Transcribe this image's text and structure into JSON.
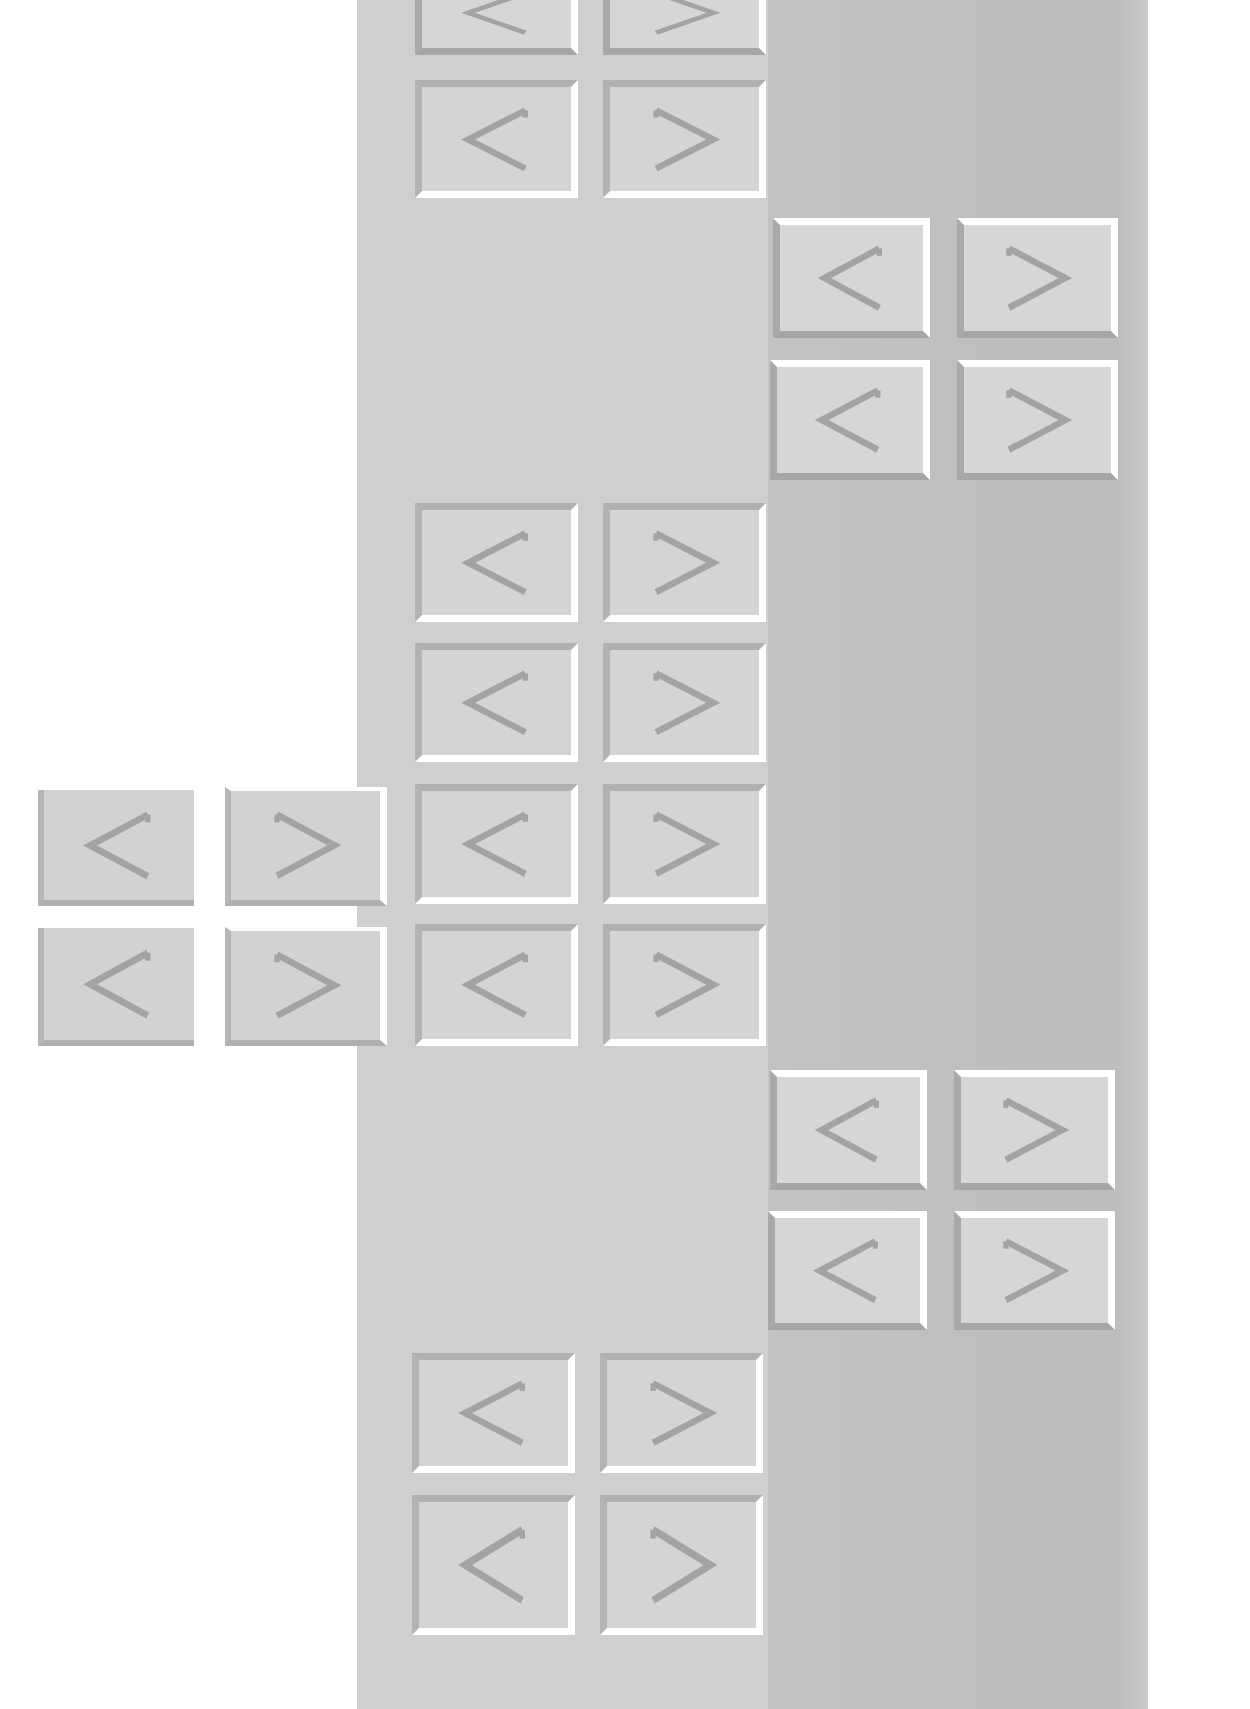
{
  "colors": {
    "page_background": "#ffffff",
    "middle_band": "#cfcfcf",
    "right_band": "#bfbfbf",
    "tile_face": "#d6d6d6",
    "highlight": "#ffffff",
    "shadow": "#a9a9a9",
    "glyph": "#a3a3a3"
  },
  "symbols": {
    "less_than": "<",
    "greater_than": ">"
  },
  "tiles": [
    {
      "id": "m0a",
      "symbol": "<",
      "style": "raised",
      "x": 415,
      "y": -30,
      "w": 163,
      "h": 85
    },
    {
      "id": "m0b",
      "symbol": ">",
      "style": "raised",
      "x": 603,
      "y": -30,
      "w": 163,
      "h": 85
    },
    {
      "id": "m1a",
      "symbol": "<",
      "style": "recessed",
      "x": 415,
      "y": 80,
      "w": 163,
      "h": 118
    },
    {
      "id": "m1b",
      "symbol": ">",
      "style": "recessed",
      "x": 603,
      "y": 80,
      "w": 163,
      "h": 118
    },
    {
      "id": "r1a",
      "symbol": "<",
      "style": "raised",
      "x": 773,
      "y": 218,
      "w": 157,
      "h": 120
    },
    {
      "id": "r1b",
      "symbol": ">",
      "style": "raised",
      "x": 957,
      "y": 218,
      "w": 161,
      "h": 120
    },
    {
      "id": "r2a",
      "symbol": "<",
      "style": "raised",
      "x": 770,
      "y": 360,
      "w": 160,
      "h": 120
    },
    {
      "id": "r2b",
      "symbol": ">",
      "style": "raised",
      "x": 957,
      "y": 360,
      "w": 161,
      "h": 120
    },
    {
      "id": "m2a",
      "symbol": "<",
      "style": "recessed",
      "x": 415,
      "y": 503,
      "w": 163,
      "h": 119
    },
    {
      "id": "m2b",
      "symbol": ">",
      "style": "recessed",
      "x": 603,
      "y": 503,
      "w": 163,
      "h": 119
    },
    {
      "id": "m3a",
      "symbol": "<",
      "style": "recessed",
      "x": 415,
      "y": 643,
      "w": 163,
      "h": 119
    },
    {
      "id": "m3b",
      "symbol": ">",
      "style": "recessed",
      "x": 603,
      "y": 643,
      "w": 163,
      "h": 119
    },
    {
      "id": "m4a",
      "symbol": "<",
      "style": "recessed",
      "x": 415,
      "y": 784,
      "w": 163,
      "h": 120
    },
    {
      "id": "m4b",
      "symbol": ">",
      "style": "recessed",
      "x": 603,
      "y": 784,
      "w": 163,
      "h": 120
    },
    {
      "id": "m5a",
      "symbol": "<",
      "style": "recessed",
      "x": 415,
      "y": 924,
      "w": 163,
      "h": 122
    },
    {
      "id": "m5b",
      "symbol": ">",
      "style": "recessed",
      "x": 603,
      "y": 924,
      "w": 163,
      "h": 122
    },
    {
      "id": "l1a",
      "symbol": "<",
      "style": "left",
      "x": 38,
      "y": 790,
      "w": 156,
      "h": 116
    },
    {
      "id": "l1b",
      "symbol": ">",
      "style": "left-edge",
      "x": 225,
      "y": 787,
      "w": 162,
      "h": 119
    },
    {
      "id": "l2a",
      "symbol": "<",
      "style": "left",
      "x": 38,
      "y": 928,
      "w": 156,
      "h": 118
    },
    {
      "id": "l2b",
      "symbol": ">",
      "style": "left-edge",
      "x": 225,
      "y": 927,
      "w": 162,
      "h": 119
    },
    {
      "id": "r3a",
      "symbol": "<",
      "style": "raised",
      "x": 770,
      "y": 1070,
      "w": 157,
      "h": 120
    },
    {
      "id": "r3b",
      "symbol": ">",
      "style": "raised",
      "x": 954,
      "y": 1070,
      "w": 161,
      "h": 120
    },
    {
      "id": "r4a",
      "symbol": "<",
      "style": "raised",
      "x": 768,
      "y": 1211,
      "w": 159,
      "h": 119
    },
    {
      "id": "r4b",
      "symbol": ">",
      "style": "raised",
      "x": 954,
      "y": 1211,
      "w": 161,
      "h": 119
    },
    {
      "id": "m6a",
      "symbol": "<",
      "style": "recessed",
      "x": 412,
      "y": 1353,
      "w": 163,
      "h": 120
    },
    {
      "id": "m6b",
      "symbol": ">",
      "style": "recessed",
      "x": 600,
      "y": 1353,
      "w": 163,
      "h": 120
    },
    {
      "id": "m7a",
      "symbol": "<",
      "style": "recessed",
      "x": 412,
      "y": 1495,
      "w": 163,
      "h": 140
    },
    {
      "id": "m7b",
      "symbol": ">",
      "style": "recessed",
      "x": 600,
      "y": 1495,
      "w": 163,
      "h": 140
    }
  ]
}
